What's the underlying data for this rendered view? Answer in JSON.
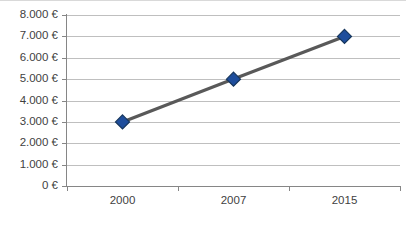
{
  "chart_data": {
    "type": "line",
    "title": "",
    "xlabel": "",
    "ylabel": "",
    "categories": [
      "2000",
      "2007",
      "2015"
    ],
    "values": [
      3000,
      5000,
      7000
    ],
    "series": [
      {
        "name": "",
        "values": [
          3000,
          5000,
          7000
        ]
      }
    ],
    "ylim": [
      0,
      8000
    ],
    "ytick_step": 1000,
    "ytick_labels": [
      "8.000 €",
      "7.000 €",
      "6.000 €",
      "5.000 €",
      "4.000 €",
      "3.000 €",
      "2.000 €",
      "1.000 €",
      "0 €"
    ],
    "ytick_values": [
      8000,
      7000,
      6000,
      5000,
      4000,
      3000,
      2000,
      1000,
      0
    ],
    "xtick_labels": [
      "2000",
      "2007",
      "2015"
    ],
    "grid": true,
    "grid_axis": "y",
    "legend": false,
    "legend_position": "none",
    "currency_symbol": "€",
    "colors": {
      "marker_fill": "#1f4e9c",
      "marker_outline": "#16365c",
      "line": "#595959",
      "gridline": "#bfbfbf",
      "axis": "#868686",
      "text": "#3f3f3f",
      "background": "#ffffff",
      "frame_border": "#d9d9d9"
    }
  }
}
